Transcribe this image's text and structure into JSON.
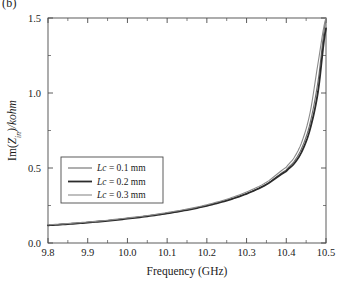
{
  "figure": {
    "panel_label": "(b)"
  },
  "chart_data": {
    "type": "line",
    "title": "",
    "xlabel": "Frequency (GHz)",
    "ylabel": "Im(Z_in)/kohm",
    "ylabel_parts": {
      "prefix": "Im(",
      "var_main": "Z",
      "var_sub": "in",
      "suffix": ")/kohm"
    },
    "xlim": [
      9.8,
      10.5
    ],
    "ylim": [
      0.0,
      1.5
    ],
    "xticks": [
      9.8,
      9.9,
      10.0,
      10.1,
      10.2,
      10.3,
      10.4,
      10.5
    ],
    "xticklabels": [
      "9.8",
      "9.9",
      "10.0",
      "10.1",
      "10.2",
      "10.3",
      "10.4",
      "10.5"
    ],
    "yticks": [
      0.0,
      0.5,
      1.0,
      1.5
    ],
    "yticklabels": [
      "0.0",
      "0.5",
      "1.0",
      "1.5"
    ],
    "x_minor_step": 0.05,
    "y_minor_step": 0.25,
    "grid": false,
    "legend_position": "center-left",
    "series": [
      {
        "name": "Lc = 0.1 mm",
        "label_var": "Lc",
        "label_value": "= 0.1 mm",
        "color": "#6e6e6e",
        "width": 1.1,
        "x": [
          9.8,
          9.85,
          9.9,
          9.95,
          10.0,
          10.05,
          10.1,
          10.15,
          10.2,
          10.25,
          10.3,
          10.35,
          10.4,
          10.42,
          10.44,
          10.46,
          10.48,
          10.5
        ],
        "y": [
          0.12,
          0.128,
          0.138,
          0.15,
          0.164,
          0.18,
          0.199,
          0.222,
          0.25,
          0.285,
          0.33,
          0.392,
          0.487,
          0.545,
          0.64,
          0.8,
          1.08,
          1.49
        ]
      },
      {
        "name": "Lc = 0.2 mm",
        "label_var": "Lc",
        "label_value": "= 0.2 mm",
        "color": "#2b2b2b",
        "width": 1.8,
        "x": [
          9.8,
          9.85,
          9.9,
          9.95,
          10.0,
          10.05,
          10.1,
          10.15,
          10.2,
          10.25,
          10.3,
          10.35,
          10.4,
          10.42,
          10.44,
          10.46,
          10.48,
          10.5
        ],
        "y": [
          0.118,
          0.126,
          0.136,
          0.148,
          0.162,
          0.178,
          0.197,
          0.22,
          0.248,
          0.283,
          0.328,
          0.39,
          0.478,
          0.53,
          0.615,
          0.76,
          1.01,
          1.43
        ]
      },
      {
        "name": "Lc = 0.3 mm",
        "label_var": "Lc",
        "label_value": "= 0.3 mm",
        "color": "#8a8a8a",
        "width": 1.1,
        "x": [
          9.8,
          9.85,
          9.9,
          9.95,
          10.0,
          10.05,
          10.1,
          10.15,
          10.2,
          10.25,
          10.3,
          10.35,
          10.4,
          10.42,
          10.44,
          10.46,
          10.48,
          10.5
        ],
        "y": [
          0.122,
          0.13,
          0.14,
          0.152,
          0.167,
          0.183,
          0.203,
          0.226,
          0.255,
          0.292,
          0.34,
          0.405,
          0.505,
          0.57,
          0.68,
          0.87,
          1.2,
          1.5
        ]
      }
    ]
  }
}
